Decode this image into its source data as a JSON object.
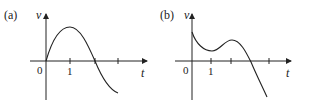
{
  "panels": [
    {
      "label": "(a)",
      "y_axis_label": "v",
      "x_axis_label": "t",
      "origin_label": "0",
      "tick_labels": [
        "1"
      ],
      "description": "Velocity starts at 0, rises to a maximum at t=1, crosses zero between t=2 and t=3 region, then decreases and levels off negative"
    },
    {
      "label": "(b)",
      "y_axis_label": "v",
      "x_axis_label": "t",
      "origin_label": "0",
      "tick_labels": [
        "1"
      ],
      "description": "Velocity starts positive, decreases to a local minimum near t=1, rises to a local maximum near t=2, then decreases, crossing zero and becoming negative"
    }
  ],
  "colors": {
    "axis": "#222222",
    "curve": "#222222",
    "background": "#ffffff"
  }
}
